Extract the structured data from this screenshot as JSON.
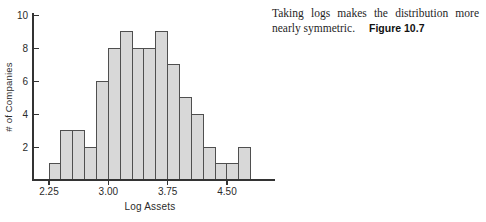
{
  "caption": {
    "line1": "Taking logs makes the distribution more",
    "line2": "nearly symmetric.",
    "figure_label": "Figure 10.7"
  },
  "chart_data": {
    "type": "bar",
    "subtype": "histogram",
    "title": "",
    "xlabel": "Log Assets",
    "ylabel": "# of Companies",
    "bin_start": 2.25,
    "bin_width": 0.15,
    "counts": [
      1,
      3,
      3,
      2,
      6,
      8,
      9,
      8,
      8,
      9,
      7,
      5,
      4,
      2,
      1,
      1,
      2
    ],
    "xticks": [
      {
        "value": 2.25,
        "label": "2.25"
      },
      {
        "value": 3.0,
        "label": "3.00"
      },
      {
        "value": 3.75,
        "label": "3.75"
      },
      {
        "value": 4.5,
        "label": "4.50"
      }
    ],
    "yticks": [
      {
        "value": 2,
        "label": "2"
      },
      {
        "value": 4,
        "label": "4"
      },
      {
        "value": 6,
        "label": "6"
      },
      {
        "value": 8,
        "label": "8"
      },
      {
        "value": 10,
        "label": "10"
      }
    ],
    "ylim": [
      0,
      10
    ],
    "xlim": [
      2.25,
      4.8
    ],
    "grid": false,
    "legend": null,
    "colors": {
      "bar_fill": "#d8d8d8",
      "bar_stroke": "#4f4f4f",
      "axis": "#333333",
      "tick_text": "#2b2b2b"
    }
  }
}
